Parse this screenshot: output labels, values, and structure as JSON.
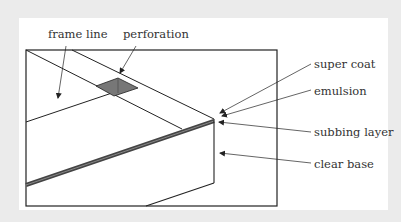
{
  "diagram": {
    "labels": {
      "frame_line": "frame line",
      "perforation": "perforation",
      "super_coat": "super coat",
      "emulsion": "emulsion",
      "subbing_layer": "subbing layer",
      "clear_base": "clear base"
    },
    "colors": {
      "background": "#ebebeb",
      "card": "#ffffff",
      "line": "#222222",
      "perforation_fill": "#777777",
      "layer_band": "#555555",
      "text": "#333333"
    }
  }
}
